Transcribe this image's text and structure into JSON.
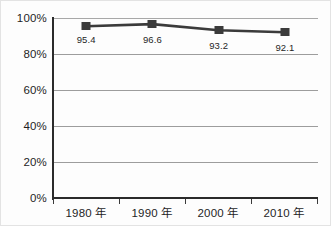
{
  "chart_data": {
    "type": "line",
    "title": "",
    "subtitle": "",
    "xlabel": "",
    "ylabel": "",
    "categories": [
      "1980 年",
      "1990 年",
      "2000 年",
      "2010 年"
    ],
    "values": [
      95.4,
      96.6,
      93.2,
      92.1
    ],
    "point_labels": [
      "95.4",
      "96.6",
      "93.2",
      "92.1"
    ],
    "series": [
      {
        "name": "",
        "values": [
          95.4,
          96.6,
          93.2,
          92.1
        ],
        "color": "#3b3b3b",
        "marker": "square"
      }
    ],
    "ylim": [
      0,
      100
    ],
    "yticks": [
      0,
      20,
      40,
      60,
      80,
      100
    ],
    "ytick_labels": [
      "0%",
      "20%",
      "40%",
      "60%",
      "80%",
      "100%"
    ],
    "grid": true,
    "grid_axis": "y",
    "legend": false,
    "legend_position": "none",
    "annotations": []
  },
  "axes": {
    "y": {
      "labels": [
        "100%",
        "80%",
        "60%",
        "40%",
        "20%",
        "0%"
      ]
    },
    "x": {
      "labels": [
        "1980 年",
        "1990 年",
        "2000 年",
        "2010 年"
      ]
    }
  },
  "colors": {
    "series": "#3b3b3b",
    "grid": "#9d9d9d",
    "axis": "#2b2b2b",
    "text": "#1f1f1f",
    "background": "#fdfdfd"
  }
}
